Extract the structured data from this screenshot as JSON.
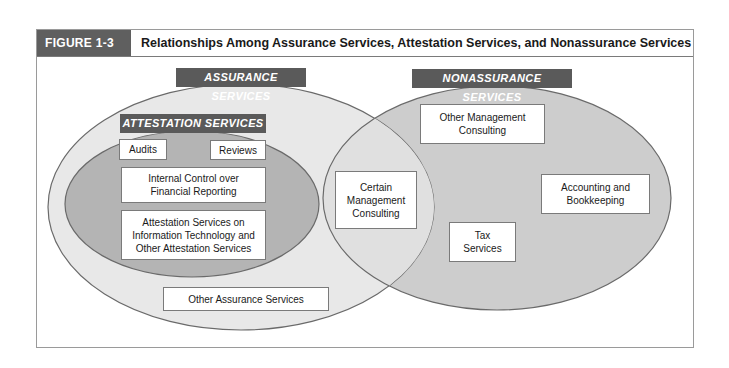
{
  "figure": {
    "label": "FIGURE 1-3",
    "title": "Relationships Among Assurance Services, Attestation Services, and Nonassurance Services"
  },
  "colors": {
    "header_label_bg": "#5f5f5f",
    "tag_bg": "#5a5a5a",
    "assurance_fill": "#e8e8e8",
    "attestation_fill": "#b4b4b4",
    "nonassurance_fill": "#cdcdcd",
    "outline": "#6a6a6a"
  },
  "sets": {
    "assurance": {
      "label": "ASSURANCE SERVICES"
    },
    "attestation": {
      "label": "ATTESTATION SERVICES"
    },
    "nonassurance": {
      "label": "NONASSURANCE SERVICES"
    }
  },
  "items": {
    "audits": "Audits",
    "reviews": "Reviews",
    "internal_control": "Internal Control over Financial Reporting",
    "attestation_it": "Attestation Services on Information Technology and Other Attestation Services",
    "other_assurance": "Other Assurance Services",
    "certain_management": "Certain Management Consulting",
    "other_management": "Other Management Consulting",
    "accounting": "Accounting and Bookkeeping",
    "tax": "Tax Services"
  }
}
